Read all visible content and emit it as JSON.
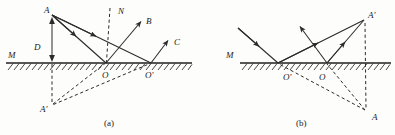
{
  "figure": {
    "background_color": "#fdfdfc",
    "ink_color": "#2b2b2b",
    "panels": [
      {
        "id": "a",
        "caption": "(a)",
        "caption_pos": [
          108,
          122
        ],
        "mirror_label": "M",
        "mirror_label_pos": [
          9,
          57
        ],
        "ground_y": 63,
        "ground_x1": 6,
        "ground_x2": 190,
        "labels": [
          {
            "name": "A",
            "text": "A",
            "x": 46,
            "y": 11
          },
          {
            "name": "N",
            "text": "N",
            "x": 120,
            "y": 12
          },
          {
            "name": "B",
            "text": "B",
            "x": 148,
            "y": 22
          },
          {
            "name": "C",
            "text": "C",
            "x": 176,
            "y": 44
          },
          {
            "name": "D",
            "text": "D",
            "x": 36,
            "y": 50
          },
          {
            "name": "M",
            "text": "M",
            "x": 9,
            "y": 57
          },
          {
            "name": "O",
            "text": "O",
            "x": 104,
            "y": 76
          },
          {
            "name": "Op",
            "text": "O'",
            "x": 146,
            "y": 76
          },
          {
            "name": "Ap",
            "text": "A'",
            "x": 42,
            "y": 110
          }
        ],
        "points": {
          "A": [
            52,
            14
          ],
          "O": [
            106,
            63
          ],
          "Op": [
            151,
            63
          ],
          "Ap": [
            52,
            105
          ],
          "N_top": [
            110,
            8
          ],
          "B_tip": [
            143,
            19
          ],
          "C_tip": [
            170,
            38
          ]
        },
        "rays": [
          {
            "name": "ray-A-to-O",
            "from": [
              52,
              14
            ],
            "to": [
              106,
              63
            ],
            "style": "solid",
            "arrow": "mid-forward"
          },
          {
            "name": "ray-A-to-Op",
            "from": [
              52,
              14
            ],
            "to": [
              151,
              63
            ],
            "style": "solid",
            "arrow": "mid-forward"
          },
          {
            "name": "ray-O-to-B",
            "from": [
              106,
              63
            ],
            "to": [
              143,
              19
            ],
            "style": "solid",
            "arrow": "end"
          },
          {
            "name": "ray-Op-to-C",
            "from": [
              151,
              63
            ],
            "to": [
              170,
              38
            ],
            "style": "solid",
            "arrow": "end"
          },
          {
            "name": "normal-at-O",
            "from": [
              110,
              8
            ],
            "to": [
              106,
              63
            ],
            "style": "dashed",
            "arrow": "none"
          },
          {
            "name": "virtual-Ap-O",
            "from": [
              52,
              105
            ],
            "to": [
              106,
              63
            ],
            "style": "dashed",
            "arrow": "none"
          },
          {
            "name": "virtual-Ap-Op",
            "from": [
              52,
              105
            ],
            "to": [
              151,
              63
            ],
            "style": "dashed",
            "arrow": "none"
          },
          {
            "name": "axis-A-Ap",
            "from": [
              52,
              63
            ],
            "to": [
              52,
              105
            ],
            "style": "dashed",
            "arrow": "none"
          }
        ],
        "dimension": {
          "name": "distance-D",
          "from": [
            52,
            16
          ],
          "to": [
            52,
            63
          ],
          "label": "D"
        }
      },
      {
        "id": "b",
        "caption": "(b)",
        "caption_pos": [
          300,
          122
        ],
        "mirror_label": "M",
        "mirror_label_pos": [
          228,
          57
        ],
        "ground_y": 63,
        "ground_x1": 240,
        "ground_x2": 390,
        "labels": [
          {
            "name": "Ap",
            "text": "A'",
            "x": 370,
            "y": 16
          },
          {
            "name": "M",
            "text": "M",
            "x": 228,
            "y": 57
          },
          {
            "name": "Op",
            "text": "O'",
            "x": 285,
            "y": 78
          },
          {
            "name": "O",
            "text": "O",
            "x": 320,
            "y": 78
          },
          {
            "name": "A",
            "text": "A",
            "x": 378,
            "y": 118
          }
        ],
        "points": {
          "Ap": [
            365,
            19
          ],
          "O": [
            327,
            63
          ],
          "Op": [
            278,
            63
          ],
          "A": [
            366,
            112
          ],
          "in1_start": [
            238,
            28
          ],
          "in1_tip": [
            278,
            63
          ],
          "up_tip": [
            299,
            25
          ]
        },
        "rays": [
          {
            "name": "incident-ray-1",
            "from": [
              238,
              28
            ],
            "to": [
              278,
              63
            ],
            "style": "solid",
            "arrow": "mid-forward"
          },
          {
            "name": "ray-Op-to-Ap",
            "from": [
              278,
              63
            ],
            "to": [
              365,
              19
            ],
            "style": "solid",
            "arrow": "mid-forward"
          },
          {
            "name": "ray-O-to-Ap",
            "from": [
              327,
              63
            ],
            "to": [
              365,
              19
            ],
            "style": "solid",
            "arrow": "mid-forward"
          },
          {
            "name": "ray-O-upleft",
            "from": [
              327,
              63
            ],
            "to": [
              299,
              25
            ],
            "style": "solid",
            "arrow": "end"
          },
          {
            "name": "virtual-A-Op",
            "from": [
              366,
              112
            ],
            "to": [
              278,
              63
            ],
            "style": "dashed",
            "arrow": "none"
          },
          {
            "name": "virtual-A-O",
            "from": [
              366,
              112
            ],
            "to": [
              327,
              63
            ],
            "style": "dashed",
            "arrow": "none"
          },
          {
            "name": "axis-Ap-A",
            "from": [
              365,
              22
            ],
            "to": [
              366,
              110
            ],
            "style": "dashed",
            "arrow": "none"
          }
        ]
      }
    ]
  }
}
